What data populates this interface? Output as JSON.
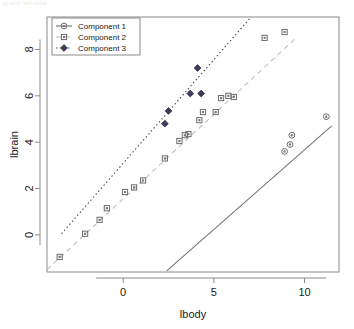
{
  "faint_header": "graph window",
  "chart_data": {
    "type": "scatter",
    "title": "",
    "xlabel": "lbody",
    "ylabel": "lbrain",
    "xlim": [
      -4.2,
      11.9
    ],
    "ylim": [
      -1.6,
      9.4
    ],
    "xticks": [
      0,
      5,
      10
    ],
    "yticks": [
      0,
      2,
      4,
      6,
      8
    ],
    "grid": false,
    "legend_position": "top-left",
    "legend": [
      {
        "label": "Component 1",
        "marker": "circle",
        "line": "solid",
        "color": "#777777"
      },
      {
        "label": "Component 2",
        "marker": "square",
        "line": "dashed",
        "color": "#bfbfbf"
      },
      {
        "label": "Component 3",
        "marker": "diamond",
        "line": "dotted",
        "color": "#404040"
      }
    ],
    "series": [
      {
        "name": "Component 1",
        "marker": "circle",
        "line": "solid",
        "color": "#777777",
        "points": [
          [
            8.9,
            3.6
          ],
          [
            9.3,
            4.3
          ],
          [
            9.2,
            3.9
          ],
          [
            11.2,
            5.1
          ]
        ],
        "fit": {
          "x0": 2.4,
          "y0": -1.55,
          "x1": 11.5,
          "y1": 4.7
        }
      },
      {
        "name": "Component 2",
        "marker": "square",
        "line": "dashed",
        "color": "#bfbfbf",
        "points": [
          [
            -3.5,
            -0.95
          ],
          [
            -2.1,
            0.05
          ],
          [
            -1.3,
            0.65
          ],
          [
            -0.9,
            1.15
          ],
          [
            0.1,
            1.85
          ],
          [
            0.6,
            2.05
          ],
          [
            1.1,
            2.35
          ],
          [
            2.3,
            3.3
          ],
          [
            3.1,
            4.05
          ],
          [
            3.4,
            4.3
          ],
          [
            3.6,
            4.35
          ],
          [
            4.2,
            4.95
          ],
          [
            4.4,
            5.3
          ],
          [
            5.1,
            5.3
          ],
          [
            5.4,
            5.9
          ],
          [
            5.8,
            6.0
          ],
          [
            6.1,
            5.95
          ],
          [
            7.8,
            8.5
          ],
          [
            8.9,
            8.75
          ]
        ],
        "fit": {
          "x0": -4.2,
          "y0": -1.5,
          "x1": 9.6,
          "y1": 8.55
        }
      },
      {
        "name": "Component 3",
        "marker": "diamond",
        "line": "dotted",
        "color": "#404040",
        "points": [
          [
            2.3,
            4.8
          ],
          [
            2.5,
            5.35
          ],
          [
            3.7,
            6.1
          ],
          [
            4.1,
            7.2
          ],
          [
            4.3,
            6.1
          ]
        ],
        "fit": {
          "x0": -3.4,
          "y0": 0.05,
          "x1": 7.0,
          "y1": 9.35
        }
      }
    ]
  }
}
